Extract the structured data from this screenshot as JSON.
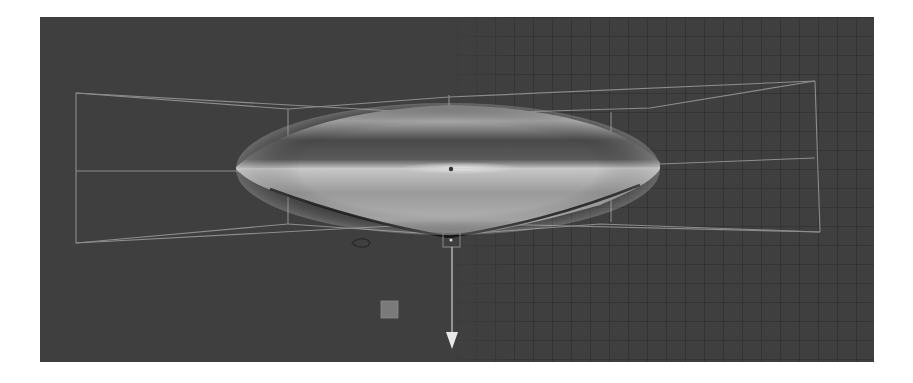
{
  "app": {
    "view": "3D viewport",
    "mode": "perspective"
  },
  "viewport": {
    "background_color": "#3f3f3f",
    "grid_color": "#2e2e2e",
    "wire_color": "#9a9a9a",
    "mesh_highlight_color": "#c4c4c4",
    "mesh_shadow_color": "#2a2a2a"
  },
  "scene": {
    "objects": [
      {
        "name": "lens-mesh",
        "type": "mesh",
        "shape": "ellipsoid-lens"
      },
      {
        "name": "lattice-cage",
        "type": "wireframe-cage"
      }
    ],
    "gizmo": {
      "type": "move-arrow",
      "axis": "down",
      "handle_icon": "square-handle"
    },
    "pivot_marker": "square",
    "icons": [
      "move-arrow-icon",
      "pivot-square-icon",
      "scale-handle-icon",
      "light-icon"
    ]
  }
}
